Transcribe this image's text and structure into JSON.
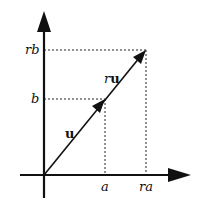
{
  "diagram": {
    "type": "vector-scaling",
    "axes": {
      "x_ticks": [
        {
          "label": "a",
          "x": 105
        },
        {
          "label": "ra",
          "x": 146
        }
      ],
      "y_ticks": [
        {
          "label": "b",
          "y": 99
        },
        {
          "label": "rb",
          "y": 50
        }
      ]
    },
    "vectors": [
      {
        "name": "u",
        "label_letter": "u",
        "from": [
          44,
          175
        ],
        "to": [
          105,
          99
        ]
      },
      {
        "name": "ru",
        "label_prefix": "r",
        "label_letter": "u",
        "from": [
          44,
          175
        ],
        "to": [
          146,
          50
        ]
      }
    ],
    "colors": {
      "line": "#111111",
      "dashed": "#222222",
      "background": "#ffffff"
    }
  }
}
